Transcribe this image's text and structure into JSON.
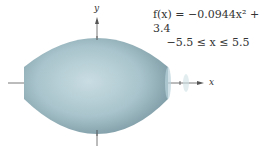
{
  "figure": {
    "equation_line1": "f(x) = −0.0944x² + 3.4",
    "equation_line2": "−5.5 ≤ x ≤ 5.5",
    "x_axis_label": "x",
    "y_axis_label": "y",
    "solid_color": "#a8c4cc",
    "solid_edge_color": "#7f9ea8"
  }
}
